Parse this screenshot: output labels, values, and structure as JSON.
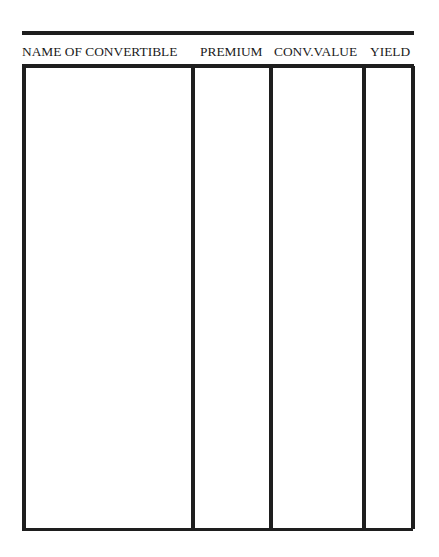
{
  "table": {
    "columns": [
      {
        "label": "NAME OF CONVERTIBLE"
      },
      {
        "label": "PREMIUM"
      },
      {
        "label": "CONV.VALUE"
      },
      {
        "label": "YIELD"
      }
    ],
    "rows": []
  },
  "colors": {
    "rule": "#1e1e1e",
    "text": "#1a1a1a",
    "background": "#ffffff"
  }
}
